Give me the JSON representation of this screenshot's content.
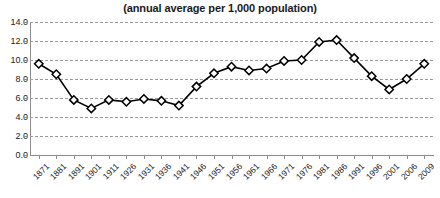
{
  "chart_data": {
    "type": "line",
    "title": "(annual average per 1,000 population)",
    "xlabel": "",
    "ylabel": "",
    "ylim": [
      0.0,
      14.0
    ],
    "ytick_labels": [
      "14.0",
      "12.0",
      "10.0",
      "8.0",
      "6.0",
      "4.0",
      "2.0",
      "0.0"
    ],
    "ytick_values": [
      14.0,
      12.0,
      10.0,
      8.0,
      6.0,
      4.0,
      2.0,
      0.0
    ],
    "grid": true,
    "legend": "none",
    "marker": "diamond-open",
    "line_color": "#000000",
    "marker_fill": "#ffffff",
    "marker_edge": "#000000",
    "categories": [
      "1871",
      "1881",
      "1891",
      "1901",
      "1911",
      "1926",
      "1931",
      "1936",
      "1941",
      "1946",
      "1951",
      "1956",
      "1961",
      "1966",
      "1971",
      "1976",
      "1981",
      "1986",
      "1991",
      "1996",
      "2001",
      "2006",
      "2009"
    ],
    "values": [
      9.6,
      8.5,
      5.8,
      4.9,
      5.8,
      5.6,
      5.9,
      5.7,
      5.2,
      7.2,
      8.6,
      9.3,
      8.9,
      9.1,
      9.9,
      10.0,
      11.9,
      12.1,
      10.2,
      8.3,
      6.9,
      8.0,
      9.6
    ]
  }
}
